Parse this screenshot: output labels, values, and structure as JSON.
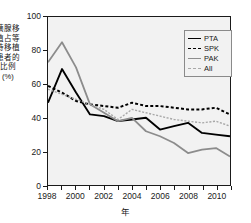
{
  "chart_data": {
    "type": "line",
    "title": "",
    "xlabel": "年",
    "ylabel": "胰腺移植占等待移植患者的 比例 (%)",
    "x": [
      1998,
      1999,
      2000,
      2001,
      2002,
      2003,
      2004,
      2005,
      2006,
      2007,
      2008,
      2009,
      2010,
      2011
    ],
    "xlim": [
      1998,
      2011
    ],
    "ylim": [
      0,
      100
    ],
    "xticks": [
      1998,
      2000,
      2002,
      2004,
      2006,
      2008,
      2010
    ],
    "xticklabels": [
      "1998",
      "2000",
      "2002",
      "2004",
      "2006",
      "2008",
      "2010"
    ],
    "yticks": [
      0,
      20,
      40,
      60,
      80,
      100
    ],
    "yticklabels": [
      "0",
      "20",
      "40",
      "60",
      "80",
      "100"
    ],
    "grid": false,
    "legend_position": "upper right",
    "series": [
      {
        "name": "PTA",
        "color": "#000000",
        "style": "solid",
        "values": [
          49,
          69,
          55,
          42,
          41,
          38,
          39,
          40,
          33,
          35,
          37,
          31,
          30,
          29
        ]
      },
      {
        "name": "SPK",
        "color": "#000000",
        "style": "dashed",
        "values": [
          59,
          55,
          50,
          48,
          47,
          46,
          49,
          47,
          47,
          46,
          45,
          45,
          46,
          42
        ]
      },
      {
        "name": "PAK",
        "color": "#8c8c8c",
        "style": "solid",
        "values": [
          73,
          85,
          70,
          48,
          43,
          38,
          40,
          32,
          29,
          25,
          19,
          21,
          22,
          17
        ]
      },
      {
        "name": "All",
        "color": "#a8a8a8",
        "style": "dashed",
        "values": [
          57,
          54,
          51,
          48,
          45,
          39,
          45,
          43,
          41,
          39,
          38,
          37,
          38,
          35
        ]
      }
    ]
  },
  "legend": {
    "items": [
      {
        "label": "PTA"
      },
      {
        "label": "SPK"
      },
      {
        "label": "PAK"
      },
      {
        "label": "All"
      }
    ]
  },
  "axes": {
    "y_title": "胰腺移植占等待移植患者的 比例 (%)",
    "x_title": "年"
  }
}
